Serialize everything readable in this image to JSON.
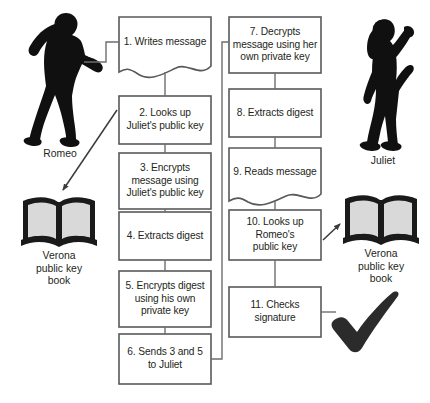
{
  "diagram": {
    "colors": {
      "background": "#ffffff",
      "box_border": "#58595b",
      "box_fill": "#ffffff",
      "connector": "#6d6e71",
      "silhouette": "#101010",
      "book_outline": "#1a1a1a",
      "book_page": "#d9d9d9",
      "check_mark": "#2b2b2b",
      "text": "#231f20"
    },
    "left_actor": {
      "name": "Romeo",
      "icon": "romeo-silhouette"
    },
    "right_actor": {
      "name": "Juliet",
      "icon": "juliet-silhouette"
    },
    "left_book": {
      "label": "Verona\npublic key\nbook",
      "icon": "open-book-icon"
    },
    "right_book": {
      "label": "Verona\npublic key\nbook",
      "icon": "open-book-icon"
    },
    "check_mark": {
      "icon": "check-mark-icon",
      "label": ""
    },
    "left_column": [
      {
        "id": "step-1",
        "number": "1.",
        "text": "1. Writes message",
        "shape": "document",
        "x": 119,
        "y": 17,
        "w": 92,
        "h": 57
      },
      {
        "id": "step-2",
        "number": "2.",
        "text": "2. Looks up\nJuliet's public key",
        "shape": "rect",
        "x": 119,
        "y": 96,
        "w": 92,
        "h": 48
      },
      {
        "id": "step-3",
        "number": "3.",
        "text": "3. Encrypts\nmessage using\nJuliet's public key",
        "shape": "rect",
        "x": 119,
        "y": 153,
        "w": 92,
        "h": 56
      },
      {
        "id": "step-4",
        "number": "4.",
        "text": "4. Extracts digest",
        "shape": "rect",
        "x": 119,
        "y": 212,
        "w": 92,
        "h": 48
      },
      {
        "id": "step-5",
        "number": "5.",
        "text": "5. Encrypts digest\nusing  his own\nprivate key",
        "shape": "rect",
        "x": 119,
        "y": 271,
        "w": 92,
        "h": 56
      },
      {
        "id": "step-6",
        "number": "6.",
        "text": "6. Sends 3 and 5\nto Juliet",
        "shape": "rect",
        "x": 119,
        "y": 334,
        "w": 92,
        "h": 50
      }
    ],
    "right_column": [
      {
        "id": "step-7",
        "number": "7.",
        "text": "7. Decrypts\nmessage using her\nown private key",
        "shape": "rect",
        "x": 229,
        "y": 17,
        "w": 92,
        "h": 56
      },
      {
        "id": "step-8",
        "number": "8.",
        "text": "8. Extracts digest",
        "shape": "rect",
        "x": 229,
        "y": 89,
        "w": 92,
        "h": 48
      },
      {
        "id": "step-9",
        "number": "9.",
        "text": "9. Reads message",
        "shape": "document",
        "x": 229,
        "y": 148,
        "w": 92,
        "h": 54
      },
      {
        "id": "step-10",
        "number": "10.",
        "text": "10. Looks up\nRomeo's\npublic key",
        "shape": "rect",
        "x": 229,
        "y": 210,
        "w": 92,
        "h": 50
      },
      {
        "id": "step-11",
        "number": "11.",
        "text": "11. Checks\nsignature",
        "shape": "rect",
        "x": 229,
        "y": 287,
        "w": 92,
        "h": 50
      }
    ]
  }
}
